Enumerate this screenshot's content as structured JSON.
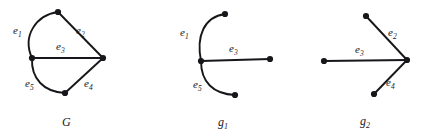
{
  "figure": {
    "stroke_color": "#17161a",
    "background_color": "#ffffff"
  },
  "panels": [
    {
      "id": "G",
      "caption": "G",
      "caption_sub": "",
      "vertices": 4,
      "edge_labels": [
        {
          "name": "e",
          "sub": "1"
        },
        {
          "name": "e",
          "sub": "2"
        },
        {
          "name": "e",
          "sub": "3"
        },
        {
          "name": "e",
          "sub": "4"
        },
        {
          "name": "e",
          "sub": "5"
        }
      ]
    },
    {
      "id": "g1",
      "caption": "g",
      "caption_sub": "1",
      "vertices": 4,
      "edge_labels": [
        {
          "name": "e",
          "sub": "1"
        },
        {
          "name": "e",
          "sub": "3"
        },
        {
          "name": "e",
          "sub": "5"
        }
      ]
    },
    {
      "id": "g2",
      "caption": "g",
      "caption_sub": "2",
      "vertices": 4,
      "edge_labels": [
        {
          "name": "e",
          "sub": "2"
        },
        {
          "name": "e",
          "sub": "3"
        },
        {
          "name": "e",
          "sub": "4"
        }
      ]
    }
  ],
  "labels": {
    "g_e1": "e",
    "g_e1_sub": "1",
    "g_e2": "e",
    "g_e2_sub": "2",
    "g_e3": "e",
    "g_e3_sub": "3",
    "g_e4": "e",
    "g_e4_sub": "4",
    "g_e5": "e",
    "g_e5_sub": "5",
    "g1_e1": "e",
    "g1_e1_sub": "1",
    "g1_e3": "e",
    "g1_e3_sub": "3",
    "g1_e5": "e",
    "g1_e5_sub": "5",
    "g2_e2": "e",
    "g2_e2_sub": "2",
    "g2_e3": "e",
    "g2_e3_sub": "3",
    "g2_e4": "e",
    "g2_e4_sub": "4",
    "caption_g": "G",
    "caption_g1": "g",
    "caption_g1_sub": "1",
    "caption_g2": "g",
    "caption_g2_sub": "2"
  }
}
